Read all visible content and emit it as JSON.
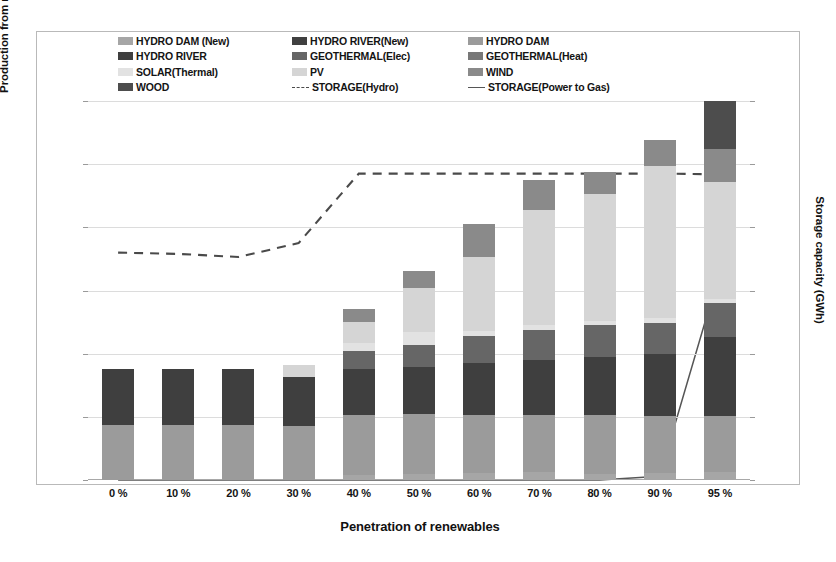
{
  "chart_data": {
    "type": "bar",
    "subtype": "stacked-bar-with-lines",
    "title": "",
    "xlabel": "Penetration of renewables",
    "ylabel": "Production from renewables (GWh)",
    "ylabel_secondary": "Storage capacity (GWh)",
    "categories": [
      "0 %",
      "10 %",
      "20 %",
      "30 %",
      "40 %",
      "50 %",
      "60 %",
      "70 %",
      "80 %",
      "90 %",
      "95 %"
    ],
    "ylim": [
      0,
      120000
    ],
    "yticks": [
      "0",
      "20000",
      "40000",
      "60000",
      "80000",
      "100000",
      "120000"
    ],
    "ylim_secondary": [
      0,
      3000
    ],
    "yticks_secondary": [
      "0",
      "500",
      "1000",
      "1500",
      "2000",
      "2500",
      "3000"
    ],
    "grid": true,
    "legend_position": "top",
    "series": [
      {
        "name": "HYDRO DAM (New)",
        "color": "#a6a6a6",
        "axis": "left",
        "kind": "bar",
        "values": [
          0,
          0,
          0,
          0,
          1500,
          1800,
          2200,
          2600,
          2000,
          2300,
          2400
        ]
      },
      {
        "name": "HYDRO RIVER(New)",
        "color": "#404040",
        "axis": "left",
        "kind": "bar",
        "values": [
          0,
          0,
          0,
          0,
          0,
          0,
          0,
          0,
          0,
          0,
          0
        ]
      },
      {
        "name": "HYDRO DAM",
        "color": "#9b9b9b",
        "axis": "left",
        "kind": "bar",
        "values": [
          17500,
          17500,
          17500,
          17000,
          19000,
          19000,
          18500,
          18000,
          18500,
          18000,
          18000
        ]
      },
      {
        "name": "HYDRO RIVER",
        "color": "#3f3f3f",
        "axis": "left",
        "kind": "bar",
        "values": [
          17500,
          17500,
          17500,
          15500,
          14500,
          15000,
          16500,
          17500,
          18500,
          19500,
          25000
        ]
      },
      {
        "name": "GEOTHERMAL(Elec)",
        "color": "#666666",
        "axis": "left",
        "kind": "bar",
        "values": [
          0,
          0,
          0,
          0,
          6000,
          7000,
          8500,
          9500,
          10000,
          10000,
          10500
        ]
      },
      {
        "name": "GEOTHERMAL(Heat)",
        "color": "#787878",
        "axis": "left",
        "kind": "bar",
        "values": [
          0,
          0,
          0,
          0,
          0,
          0,
          0,
          0,
          0,
          0,
          0
        ]
      },
      {
        "name": "SOLAR(Thermal)",
        "color": "#e2e2e2",
        "axis": "left",
        "kind": "bar",
        "values": [
          0,
          0,
          0,
          0,
          2500,
          4000,
          1500,
          1500,
          1500,
          1500,
          1500
        ]
      },
      {
        "name": "PV",
        "color": "#d5d5d5",
        "axis": "left",
        "kind": "bar",
        "values": [
          0,
          0,
          0,
          4000,
          6500,
          14000,
          23500,
          36500,
          40000,
          48000,
          37000
        ]
      },
      {
        "name": "WIND",
        "color": "#8a8a8a",
        "axis": "left",
        "kind": "bar",
        "values": [
          0,
          0,
          0,
          0,
          4000,
          5500,
          10500,
          9500,
          7000,
          8500,
          10500
        ]
      },
      {
        "name": "WOOD",
        "color": "#4d4d4d",
        "axis": "left",
        "kind": "bar",
        "values": [
          0,
          0,
          0,
          0,
          0,
          0,
          0,
          0,
          0,
          0,
          15000
        ]
      },
      {
        "name": "STORAGE(Hydro)",
        "color": "#4a4a4a",
        "axis": "right",
        "kind": "line-dashed",
        "values": [
          1800,
          1790,
          1765,
          1875,
          2425,
          2425,
          2425,
          2425,
          2425,
          2425,
          2420
        ]
      },
      {
        "name": "STORAGE(Power to Gas)",
        "color": "#565656",
        "axis": "right",
        "kind": "line-solid",
        "values": [
          0,
          0,
          0,
          0,
          0,
          0,
          0,
          0,
          0,
          30,
          1650
        ]
      }
    ],
    "bar_totals": [
      35000,
      35000,
      35000,
      36500,
      54000,
      66300,
      81200,
      95100,
      97500,
      107800,
      119900
    ]
  },
  "legend": {
    "columns": [
      [
        {
          "label": "HYDRO DAM (New)",
          "swatch": "#a6a6a6",
          "marker": "box"
        },
        {
          "label": "HYDRO RIVER",
          "swatch": "#3f3f3f",
          "marker": "box"
        },
        {
          "label": "SOLAR(Thermal)",
          "swatch": "#e2e2e2",
          "marker": "box"
        },
        {
          "label": "WOOD",
          "swatch": "#4d4d4d",
          "marker": "box"
        }
      ],
      [
        {
          "label": "HYDRO RIVER(New)",
          "swatch": "#404040",
          "marker": "box"
        },
        {
          "label": "GEOTHERMAL(Elec)",
          "swatch": "#666666",
          "marker": "box"
        },
        {
          "label": "PV",
          "swatch": "#d5d5d5",
          "marker": "box"
        },
        {
          "label": "STORAGE(Hydro)",
          "swatch": "#4a4a4a",
          "marker": "dash"
        }
      ],
      [
        {
          "label": "HYDRO DAM",
          "swatch": "#9b9b9b",
          "marker": "box"
        },
        {
          "label": "GEOTHERMAL(Heat)",
          "swatch": "#787878",
          "marker": "box"
        },
        {
          "label": "WIND",
          "swatch": "#8a8a8a",
          "marker": "box"
        },
        {
          "label": "STORAGE(Power to Gas)",
          "swatch": "#565656",
          "marker": "line"
        }
      ]
    ]
  },
  "colors": {
    "frame": "#b9b9b9",
    "grid": "#dcdcdc",
    "axis": "#a8a8a8",
    "text": "#141414"
  }
}
